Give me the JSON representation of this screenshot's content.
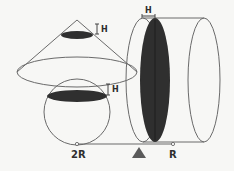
{
  "diagram": {
    "labels": {
      "cone_slice_height": "H",
      "sphere_slice_height": "H",
      "cylinder_slice_height": "H",
      "left_arm": "2R",
      "right_arm": "R"
    },
    "colors": {
      "background": "#f7f7f5",
      "outline": "#6a6a6a",
      "slice_fill": "#2f2f2f",
      "fulcrum": "#5a5a5a",
      "text": "#2e2e2e"
    },
    "shapes": [
      "cone",
      "sphere",
      "cylinder",
      "lever",
      "fulcrum"
    ]
  }
}
